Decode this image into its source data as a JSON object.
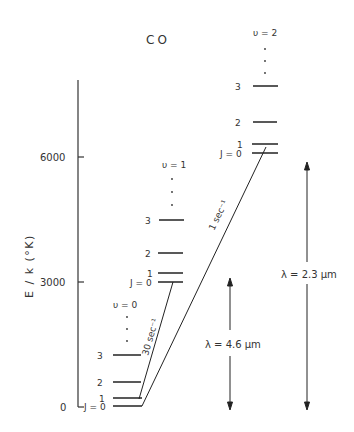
{
  "title": "CO",
  "y_axis": {
    "label": "E / k (°K)",
    "ticks": [
      {
        "value": "6000",
        "y": 157
      },
      {
        "value": "3000",
        "y": 282
      },
      {
        "value": "0",
        "y": 407
      }
    ]
  },
  "bands": [
    {
      "name": "v0",
      "label": "υ = 0",
      "x1": 113,
      "x2": 142,
      "levels": [
        {
          "J": "J = 0",
          "y": 406
        },
        {
          "J": "1",
          "y": 398
        },
        {
          "J": "2",
          "y": 382
        },
        {
          "J": "3",
          "y": 355
        }
      ]
    },
    {
      "name": "v1",
      "label": "υ = 1",
      "x1": 158,
      "x2": 183,
      "levels": [
        {
          "J": "J = 0",
          "y": 282
        },
        {
          "J": "1",
          "y": 273
        },
        {
          "J": "2",
          "y": 253
        },
        {
          "J": "3",
          "y": 220
        }
      ]
    },
    {
      "name": "v2",
      "label": "υ = 2",
      "x1": 252,
      "x2": 278,
      "levels": [
        {
          "J": "J = 0",
          "y": 153
        },
        {
          "J": "1",
          "y": 144
        },
        {
          "J": "2",
          "y": 122
        },
        {
          "J": "3",
          "y": 86
        }
      ]
    }
  ],
  "transitions": [
    {
      "label": "30 sec⁻¹",
      "from": "v1 J=0",
      "to": "v0 J=1"
    },
    {
      "label": "1 sec⁻¹",
      "from": "v2 J=0",
      "to": "v0 J=0"
    }
  ],
  "wavelengths": [
    {
      "label": "λ = 4.6 μm"
    },
    {
      "label": "λ = 2.3 μm"
    }
  ]
}
